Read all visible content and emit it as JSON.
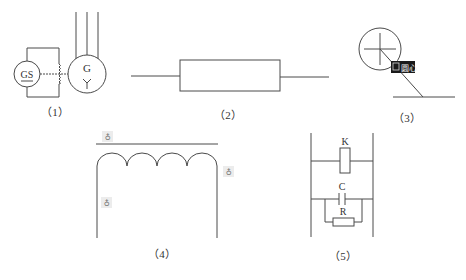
{
  "figures": [
    {
      "id": 1,
      "caption": "（1）",
      "description": "Generator G with three output leads, excited by GS through a tapped winding",
      "labels": {
        "exciter": "GS",
        "generator": "G",
        "wye_symbol": "Y"
      }
    },
    {
      "id": 2,
      "caption": "（2）",
      "description": "Rectangular component symbol with two leads"
    },
    {
      "id": 3,
      "caption": "（3）",
      "description": "Circle with center crosshair, CAD object-snap tooltip, leader line to horizontal line",
      "snap_tooltip": {
        "icon": "center-snap-icon",
        "text": "圆心"
      }
    },
    {
      "id": 4,
      "caption": "（4）",
      "description": "Inductor coil with four turns under a straight line, with CAD grip markers",
      "coil_turns": 4,
      "grip_markers": 3
    },
    {
      "id": 5,
      "caption": "（5）",
      "description": "Relay coil K in parallel with an RC snubber between two rails",
      "labels": {
        "relay": "K",
        "capacitor": "C",
        "resistor": "R"
      }
    }
  ],
  "colors": {
    "line": "#4a4a4a",
    "text": "#333333",
    "tooltip_bg": "#1a1a1a",
    "tooltip_text": "#f0f0f0",
    "grip_bg": "#ececec"
  }
}
